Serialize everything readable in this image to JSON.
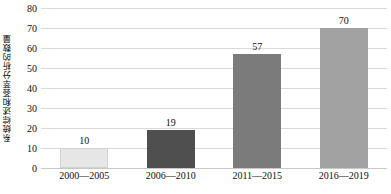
{
  "chart_data": {
    "type": "bar",
    "title": "",
    "subtitle": "",
    "xlabel": "",
    "ylabel": "系统综述和荟萃分析的数量",
    "categories": [
      "2000—2005",
      "2006—2010",
      "2011—2015",
      "2016—2019"
    ],
    "values": [
      10,
      19,
      57,
      70
    ],
    "data_labels": [
      "10",
      "19",
      "57",
      "70"
    ],
    "series": [
      {
        "name": "系统综述和荟萃分析的数量",
        "values": [
          10,
          19,
          57,
          70
        ]
      }
    ],
    "ylim": [
      0,
      80
    ],
    "ytick_step": 10,
    "ytick_labels": [
      "0",
      "10",
      "20",
      "30",
      "40",
      "50",
      "60",
      "70",
      "80"
    ],
    "ytick_values": [
      0,
      10,
      20,
      30,
      40,
      50,
      60,
      70,
      80
    ],
    "grid": true,
    "grid_axis": "y",
    "legend": false,
    "legend_position": "none",
    "bar_colors": [
      "#e6e6e6",
      "#4f4f4f",
      "#7b7b7b",
      "#a2a2a2"
    ],
    "bar_border_color": "#d0d0d0",
    "gridline_color": "#d9d9d9",
    "axis_color": "#c8c8c8",
    "background_color": "#ffffff",
    "text_color": "#101010"
  }
}
